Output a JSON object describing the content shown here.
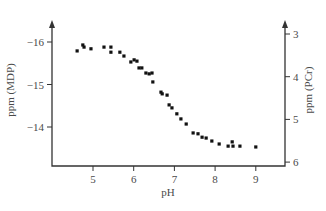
{
  "chart_data": {
    "type": "scatter",
    "title": "",
    "xlabel": "pH",
    "ylabel": "ppm (MDP)",
    "y2label": "ppm (PCr)",
    "xlim": [
      4.0,
      9.3
    ],
    "ylim": [
      -16.5,
      -13.0
    ],
    "y2lim": [
      2.6,
      6.1
    ],
    "x_ticks": [
      5,
      6,
      7,
      8,
      9
    ],
    "y_ticks": [
      -16,
      -15,
      -14
    ],
    "y_tick_labels": [
      "−16",
      "−15",
      "−14"
    ],
    "y2_ticks": [
      3,
      4,
      5,
      6
    ],
    "grid": false,
    "legend": null,
    "series": [
      {
        "name": "MDP chemical shift vs pH",
        "marker": "square",
        "x": [
          4.61,
          4.75,
          4.78,
          4.95,
          5.27,
          5.44,
          5.44,
          5.66,
          5.76,
          5.93,
          6.01,
          6.08,
          6.13,
          6.2,
          6.3,
          6.38,
          6.45,
          6.47,
          6.67,
          6.7,
          6.82,
          6.87,
          6.94,
          7.06,
          7.16,
          7.29,
          7.46,
          7.58,
          7.68,
          7.78,
          7.92,
          8.1,
          8.32,
          8.42,
          8.44,
          8.61,
          9.0
        ],
        "y": [
          -15.79,
          -15.93,
          -15.88,
          -15.84,
          -15.88,
          -15.88,
          -15.76,
          -15.76,
          -15.67,
          -15.53,
          -15.58,
          -15.55,
          -15.39,
          -15.39,
          -15.27,
          -15.25,
          -15.27,
          -15.06,
          -14.82,
          -14.78,
          -14.75,
          -14.52,
          -14.45,
          -14.31,
          -14.19,
          -14.07,
          -13.86,
          -13.84,
          -13.76,
          -13.74,
          -13.67,
          -13.6,
          -13.55,
          -13.65,
          -13.55,
          -13.55,
          -13.53
        ]
      }
    ]
  },
  "layout": {
    "plot_left_px": 52,
    "plot_right_px": 285,
    "plot_bottom_px": 166,
    "axis_top_px": 20,
    "x_px_at_5": 93,
    "x_px_per_unit": 40.7,
    "y_px_at_minus16": 42,
    "y_px_per_unit": 42.5,
    "y2_px_at_3": 34,
    "y2_px_per_unit": 42.7
  }
}
